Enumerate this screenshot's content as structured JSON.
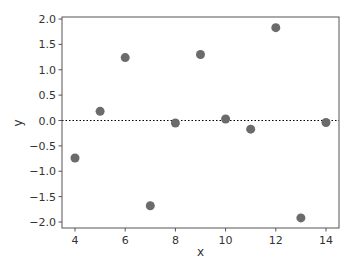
{
  "chart_data": {
    "type": "scatter",
    "title": "",
    "xlabel": "x",
    "ylabel": "y",
    "xlim": [
      3.5,
      14.5
    ],
    "ylim": [
      -2.1,
      2.05
    ],
    "xticks": [
      4,
      6,
      8,
      10,
      12,
      14
    ],
    "yticks": [
      2.0,
      1.5,
      1.0,
      0.5,
      0.0,
      -0.5,
      -1.0,
      -1.5,
      -2.0
    ],
    "ytick_labels": [
      "2.0",
      "1.5",
      "1.0",
      "0.5",
      "0.0",
      "−0.5",
      "−1.0",
      "−1.5",
      "−2.0"
    ],
    "grid": false,
    "legend": null,
    "reference_line": {
      "y": 0.0,
      "style": "dotted",
      "color": "#000000"
    },
    "marker_color": "#6b6b6b",
    "x": [
      4,
      5,
      6,
      7,
      8,
      9,
      10,
      11,
      12,
      13,
      14
    ],
    "y": [
      -0.74,
      0.18,
      1.24,
      -1.68,
      -0.05,
      1.3,
      0.03,
      -0.17,
      1.83,
      -1.92,
      -0.04
    ]
  }
}
